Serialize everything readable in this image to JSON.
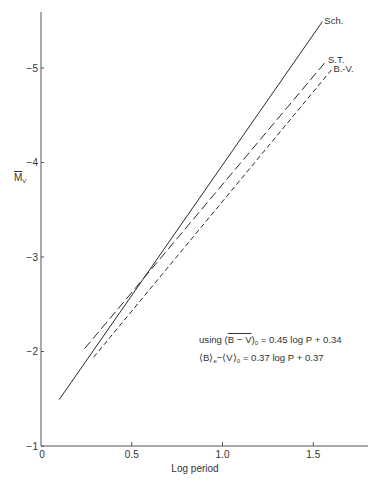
{
  "chart_data": {
    "type": "line",
    "title": "",
    "xlabel": "Log period",
    "ylabel": "M̄_V",
    "xlim": [
      0,
      1.8
    ],
    "ylim": [
      -1,
      -5.6
    ],
    "y_inverted": true,
    "grid": false,
    "x_ticks": [
      {
        "value": 0,
        "label": "0"
      },
      {
        "value": 0.5,
        "label": "0.5"
      },
      {
        "value": 1.0,
        "label": "1.0"
      },
      {
        "value": 1.5,
        "label": "1.5"
      }
    ],
    "y_ticks": [
      {
        "value": -1,
        "label": "−1"
      },
      {
        "value": -2,
        "label": "−2"
      },
      {
        "value": -3,
        "label": "−3"
      },
      {
        "value": -4,
        "label": "−4"
      },
      {
        "value": -5,
        "label": "−5"
      }
    ],
    "series": [
      {
        "name": "Sch.",
        "style": "solid",
        "x": [
          0.1,
          1.55
        ],
        "y": [
          -1.49,
          -5.49
        ]
      },
      {
        "name": "S.T.",
        "style": "long-dash",
        "x": [
          0.24,
          1.57
        ],
        "y": [
          -2.03,
          -5.07
        ]
      },
      {
        "name": "B.-V.",
        "style": "short-dash",
        "x": [
          0.29,
          1.6
        ],
        "y": [
          -1.94,
          -4.98
        ]
      }
    ],
    "annotations": [
      "using (B−V)₀ = 0.45 log P + 0.34",
      "⟨B⟩ₑ − ⟨V⟩₀ = 0.37 log P + 0.37"
    ],
    "legend_position": "inline at line ends (top right)"
  },
  "labels": {
    "xlabel": "Log period",
    "ylabel_main": "M",
    "ylabel_sub": "V",
    "note1_prefix": "using (",
    "note1_over": "B − V",
    "note1_close": ")",
    "note1_sub": "0",
    "note1_rest": " = 0.45 log P + 0.34",
    "note2_b": "⟨B⟩",
    "note2_b_sub": "e",
    "note2_mid": "−⟨V⟩",
    "note2_v_sub": "0",
    "note2_rest": " = 0.37 log P + 0.37"
  },
  "colors": {
    "ink": "#2a2a2a",
    "axis": "#555555",
    "background": "#ffffff"
  }
}
